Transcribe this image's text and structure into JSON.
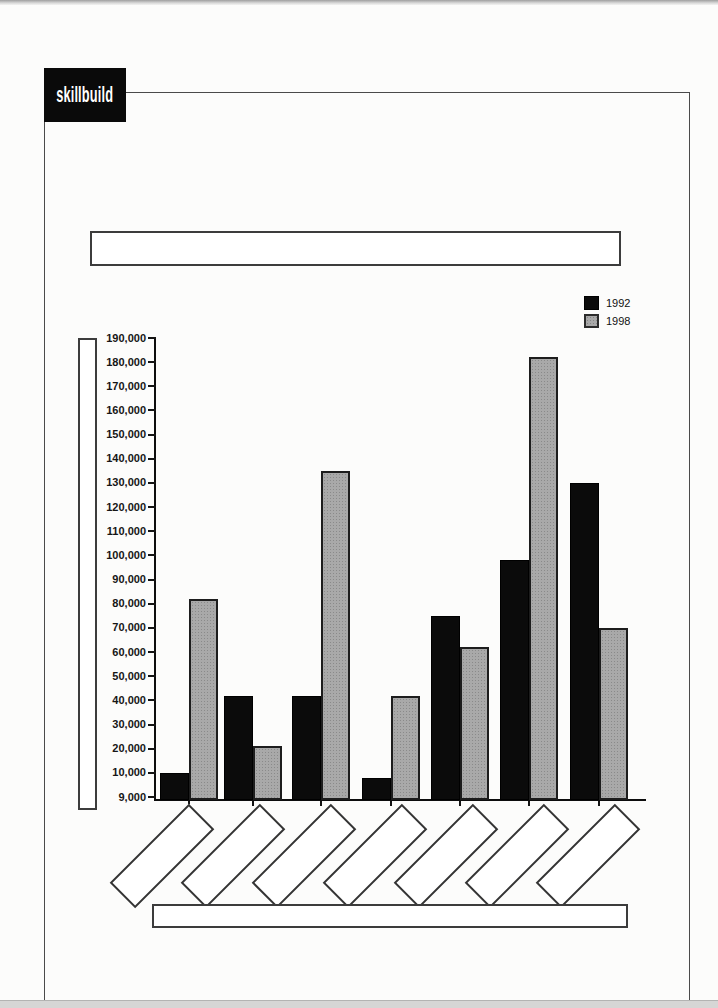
{
  "logo": {
    "text": "skillbuild"
  },
  "legend": {
    "items": [
      {
        "label": "1992",
        "color": "#0b0b0b"
      },
      {
        "label": "1998",
        "color": "#a9a9a9"
      }
    ]
  },
  "placeholders": {
    "chart_title_box": "",
    "y_axis_title_box": "",
    "x_axis_title_box": "",
    "category_label_boxes": [
      "",
      "",
      "",
      "",
      "",
      "",
      ""
    ]
  },
  "chart_data": {
    "type": "bar",
    "title": "",
    "xlabel": "",
    "ylabel": "",
    "categories": [
      "",
      "",
      "",
      "",
      "",
      "",
      ""
    ],
    "series": [
      {
        "name": "1992",
        "color": "#0b0b0b",
        "values": [
          10000,
          42000,
          42000,
          9800,
          75000,
          98000,
          130000
        ]
      },
      {
        "name": "1998",
        "color": "#a9a9a9",
        "values": [
          82000,
          21000,
          135000,
          42000,
          62000,
          182000,
          70000
        ]
      }
    ],
    "ylim": [
      9000,
      190000
    ],
    "y_tick_labels": [
      "190,000",
      "180,000",
      "170,000",
      "160,000",
      "150,000",
      "140,000",
      "130,000",
      "120,000",
      "110,000",
      "100,000",
      "90,000",
      "80,000",
      "70,000",
      "60,000",
      "50,000",
      "40,000",
      "30,000",
      "20,000",
      "10,000",
      "9,000"
    ],
    "grid": "off",
    "legend_position": "top-right"
  }
}
